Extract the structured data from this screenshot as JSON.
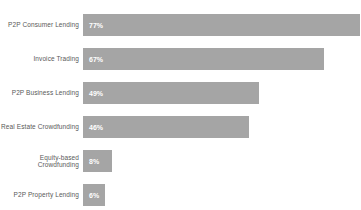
{
  "chart_data": {
    "type": "bar",
    "orientation": "horizontal",
    "title": "",
    "xlabel": "",
    "ylabel": "",
    "xlim": [
      0,
      100
    ],
    "grid": false,
    "legend": false,
    "categories": [
      "P2P Consumer Lending",
      "Invoice Trading",
      "P2P Business Lending",
      "Real Estate Crowdfunding",
      "Equity-based Crowdfunding",
      "P2P Property Lending"
    ],
    "values": [
      77,
      67,
      49,
      46,
      8,
      6
    ],
    "value_labels": [
      "77%",
      "67%",
      "49%",
      "46%",
      "8%",
      "6%"
    ],
    "colors": {
      "bar": "#a5a5a5",
      "value_label": "#ffffff",
      "category_label": "#595959",
      "background": "#ffffff"
    },
    "px_per_percent": 3.6
  }
}
